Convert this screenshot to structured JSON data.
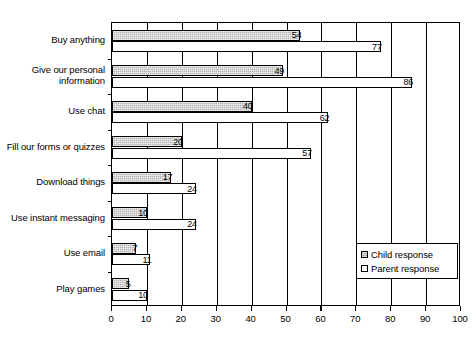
{
  "chart_data": {
    "type": "bar",
    "orientation": "horizontal",
    "title": "",
    "xlabel": "",
    "ylabel": "",
    "xlim": [
      0,
      100
    ],
    "xticks": [
      0,
      10,
      20,
      30,
      40,
      50,
      60,
      70,
      80,
      90,
      100
    ],
    "grid": true,
    "grid_axis": "x",
    "legend_position": "bottom-right",
    "categories": [
      "Buy anything",
      "Give our personal\ninformation",
      "Use chat",
      "Fill our forms or quizzes",
      "Download things",
      "Use instant messaging",
      "Use email",
      "Play games"
    ],
    "series": [
      {
        "name": "Child response",
        "color": "#b3b3b3",
        "values": [
          54,
          49,
          40,
          20,
          17,
          10,
          7,
          5
        ]
      },
      {
        "name": "Parent response",
        "color": "#ffffff",
        "values": [
          77,
          86,
          62,
          57,
          24,
          24,
          11,
          10
        ]
      }
    ]
  },
  "legend": {
    "items": [
      {
        "label": "Child response"
      },
      {
        "label": "Parent response"
      }
    ]
  }
}
